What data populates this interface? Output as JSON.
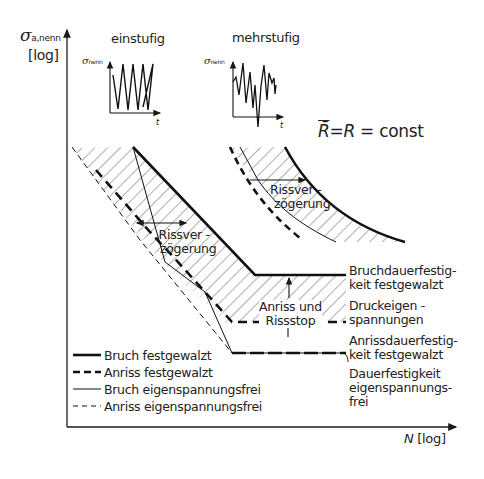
{
  "axes": {
    "y_symbol": "σ",
    "y_subscript": "a,nenn",
    "y_scale": "[log]",
    "x_symbol": "N",
    "x_scale": "[log]"
  },
  "insets": [
    {
      "title": "einstufig",
      "y_label_symbol": "σ",
      "y_label_sub": "nenn",
      "x_label": "t"
    },
    {
      "title": "mehrstufig",
      "y_label_symbol": "σ",
      "y_label_sub": "nenn",
      "x_label": "t"
    }
  ],
  "condition": {
    "lhs": "R̄",
    "eq1": "=",
    "mid": "R",
    "eq2": " = const"
  },
  "annotations": {
    "rissverzoegerung_1": [
      "Rissver -",
      "zögerung"
    ],
    "rissverzoegerung_2": [
      "Rissver -",
      "zögerung"
    ],
    "anriss_rissstop": [
      "Anriss und",
      "Rissstop"
    ]
  },
  "right_labels": [
    {
      "lines": [
        "Bruchdauerfestig-",
        "keit festgewalzt"
      ]
    },
    {
      "lines": [
        "Druckeigen -",
        "spannungen"
      ]
    },
    {
      "lines": [
        "Anrissdauerfestig-",
        "keit festgewalzt"
      ]
    },
    {
      "lines": [
        "Dauerfestigkeit",
        "eigenspannungs-",
        "frei"
      ]
    }
  ],
  "legend": [
    {
      "label": "Bruch festgewalzt",
      "style": "thick-solid"
    },
    {
      "label": "Anriss festgewalzt",
      "style": "thick-dashed"
    },
    {
      "label": "Bruch eigenspannungsfrei",
      "style": "thin-solid"
    },
    {
      "label": "Anriss eigenspannungsfrei",
      "style": "thin-dashed"
    }
  ],
  "colors": {
    "ink": "#1a1a1a",
    "background": "#ffffff"
  }
}
